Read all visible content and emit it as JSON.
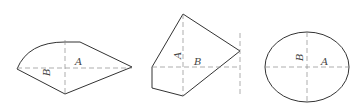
{
  "figures": [
    {
      "id": "kite-with-arc",
      "labels": {
        "a": "A",
        "b": "B"
      }
    },
    {
      "id": "pentagon",
      "labels": {
        "a": "A",
        "b": "B"
      }
    },
    {
      "id": "ellipse",
      "labels": {
        "a": "A",
        "b": "B"
      }
    }
  ],
  "colors": {
    "outline": "#333333",
    "axis": "#8a8a8a",
    "label": "#444444"
  }
}
